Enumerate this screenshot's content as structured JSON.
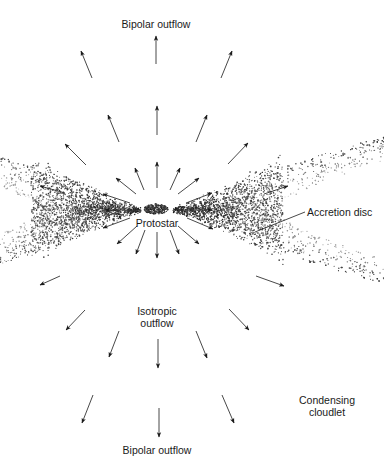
{
  "diagram": {
    "labels": {
      "top_outflow": "Bipolar outflow",
      "bottom_outflow": "Bipolar outflow",
      "protostar": "Protostar",
      "isotropic_line1": "Isotropic",
      "isotropic_line2": "outflow",
      "accretion_disc": "Accretion disc",
      "cloudlet_line1": "Condensing",
      "cloudlet_line2": "cloudlet"
    },
    "colors": {
      "ink": "#1a1a1a",
      "arrow": "#333333",
      "background": "#ffffff"
    },
    "protostar": {
      "cx": 156,
      "cy": 209,
      "rx": 12,
      "ry": 5
    },
    "arrows": [
      {
        "x1": 156,
        "y1": 64,
        "x2": 156,
        "y2": 36
      },
      {
        "x1": 92,
        "y1": 78,
        "x2": 81,
        "y2": 51
      },
      {
        "x1": 221,
        "y1": 78,
        "x2": 232,
        "y2": 51
      },
      {
        "x1": 119,
        "y1": 142,
        "x2": 108,
        "y2": 115
      },
      {
        "x1": 157,
        "y1": 135,
        "x2": 157,
        "y2": 106
      },
      {
        "x1": 196,
        "y1": 142,
        "x2": 207,
        "y2": 115
      },
      {
        "x1": 86,
        "y1": 165,
        "x2": 65,
        "y2": 144
      },
      {
        "x1": 228,
        "y1": 164,
        "x2": 248,
        "y2": 143
      },
      {
        "x1": 157,
        "y1": 188,
        "x2": 157,
        "y2": 162
      },
      {
        "x1": 144,
        "y1": 190,
        "x2": 135,
        "y2": 168
      },
      {
        "x1": 170,
        "y1": 190,
        "x2": 180,
        "y2": 168
      },
      {
        "x1": 136,
        "y1": 194,
        "x2": 116,
        "y2": 178
      },
      {
        "x1": 178,
        "y1": 194,
        "x2": 199,
        "y2": 178
      },
      {
        "x1": 130,
        "y1": 203,
        "x2": 103,
        "y2": 194
      },
      {
        "x1": 186,
        "y1": 203,
        "x2": 212,
        "y2": 193
      },
      {
        "x1": 137,
        "y1": 210,
        "x2": 105,
        "y2": 210
      },
      {
        "x1": 178,
        "y1": 210,
        "x2": 212,
        "y2": 210
      },
      {
        "x1": 130,
        "y1": 218,
        "x2": 103,
        "y2": 228
      },
      {
        "x1": 187,
        "y1": 218,
        "x2": 213,
        "y2": 229
      },
      {
        "x1": 137,
        "y1": 226,
        "x2": 117,
        "y2": 244
      },
      {
        "x1": 178,
        "y1": 226,
        "x2": 199,
        "y2": 244
      },
      {
        "x1": 145,
        "y1": 230,
        "x2": 136,
        "y2": 254
      },
      {
        "x1": 170,
        "y1": 230,
        "x2": 179,
        "y2": 254
      },
      {
        "x1": 157,
        "y1": 232,
        "x2": 157,
        "y2": 258
      },
      {
        "x1": 85,
        "y1": 310,
        "x2": 66,
        "y2": 330
      },
      {
        "x1": 229,
        "y1": 309,
        "x2": 249,
        "y2": 330
      },
      {
        "x1": 119,
        "y1": 331,
        "x2": 109,
        "y2": 357
      },
      {
        "x1": 158,
        "y1": 339,
        "x2": 158,
        "y2": 368
      },
      {
        "x1": 196,
        "y1": 331,
        "x2": 207,
        "y2": 358
      },
      {
        "x1": 93,
        "y1": 395,
        "x2": 82,
        "y2": 423
      },
      {
        "x1": 159,
        "y1": 408,
        "x2": 159,
        "y2": 437
      },
      {
        "x1": 222,
        "y1": 395,
        "x2": 234,
        "y2": 423
      },
      {
        "x1": 65,
        "y1": 193,
        "x2": 40,
        "y2": 186
      },
      {
        "x1": 60,
        "y1": 276,
        "x2": 40,
        "y2": 285
      },
      {
        "x1": 264,
        "y1": 194,
        "x2": 288,
        "y2": 186
      },
      {
        "x1": 256,
        "y1": 276,
        "x2": 284,
        "y2": 286
      }
    ],
    "leader_lines": [
      {
        "x1": 305,
        "y1": 212,
        "x2": 255,
        "y2": 232,
        "name": "accretion-disc-leader"
      }
    ]
  }
}
